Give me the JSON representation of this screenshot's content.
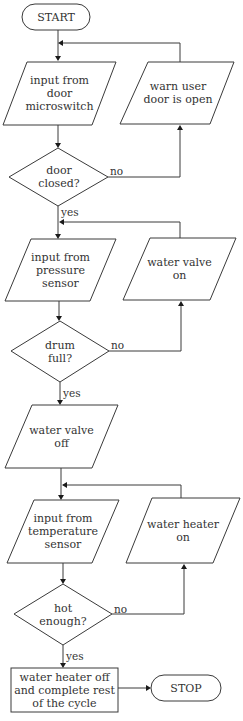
{
  "diagram": {
    "type": "flowchart",
    "colors": {
      "stroke": "#3a3a3a",
      "text": "#333333",
      "background": "#ffffff"
    },
    "nodes": {
      "start": {
        "shape": "terminator",
        "label": "START"
      },
      "input_door": {
        "shape": "parallelogram",
        "label": "input from\ndoor\nmicroswitch"
      },
      "warn_door": {
        "shape": "parallelogram",
        "label": "warn user\ndoor is open"
      },
      "door_closed": {
        "shape": "decision",
        "label": "door\nclosed?"
      },
      "input_pressure": {
        "shape": "parallelogram",
        "label": "input from\npressure\nsensor"
      },
      "valve_on": {
        "shape": "parallelogram",
        "label": "water valve\non"
      },
      "drum_full": {
        "shape": "decision",
        "label": "drum\nfull?"
      },
      "valve_off": {
        "shape": "parallelogram",
        "label": "water valve\noff"
      },
      "input_temp": {
        "shape": "parallelogram",
        "label": "input from\ntemperature\nsensor"
      },
      "heater_on": {
        "shape": "parallelogram",
        "label": "water heater\non"
      },
      "hot_enough": {
        "shape": "decision",
        "label": "hot\nenough?"
      },
      "heater_off": {
        "shape": "process",
        "label": "water heater off\nand complete rest\nof the cycle"
      },
      "stop": {
        "shape": "terminator",
        "label": "STOP"
      }
    },
    "edge_labels": {
      "door_no": "no",
      "door_yes": "yes",
      "drum_no": "no",
      "drum_yes": "yes",
      "hot_no": "no",
      "hot_yes": "yes"
    }
  }
}
